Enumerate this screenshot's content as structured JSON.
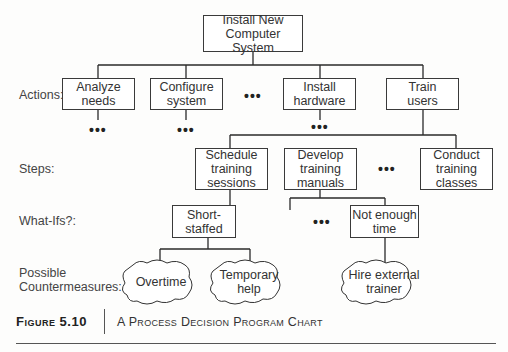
{
  "diagram": {
    "root": {
      "label": "Install New\nComputer System"
    },
    "row_labels": {
      "actions": "Actions:",
      "steps": "Steps:",
      "what_ifs": "What-Ifs?:",
      "countermeasures": "Possible\nCountermeasures:"
    },
    "actions": [
      {
        "label": "Analyze\nneeds"
      },
      {
        "label": "Configure\nsystem"
      },
      {
        "label": "Install\nhardware"
      },
      {
        "label": "Train\nusers"
      }
    ],
    "steps": [
      {
        "label": "Schedule\ntraining\nsessions"
      },
      {
        "label": "Develop\ntraining\nmanuals"
      },
      {
        "label": "Conduct\ntraining\nclasses"
      }
    ],
    "what_ifs": [
      {
        "label": "Short-\nstaffed"
      },
      {
        "label": "Not enough\ntime"
      }
    ],
    "countermeasures": [
      {
        "label": "Overtime"
      },
      {
        "label": "Temporary\nhelp"
      },
      {
        "label": "Hire external\ntrainer"
      }
    ],
    "ellipsis": "•••"
  },
  "caption": {
    "figure": "Figure 5.10",
    "title": "A Process Decision Program Chart"
  }
}
